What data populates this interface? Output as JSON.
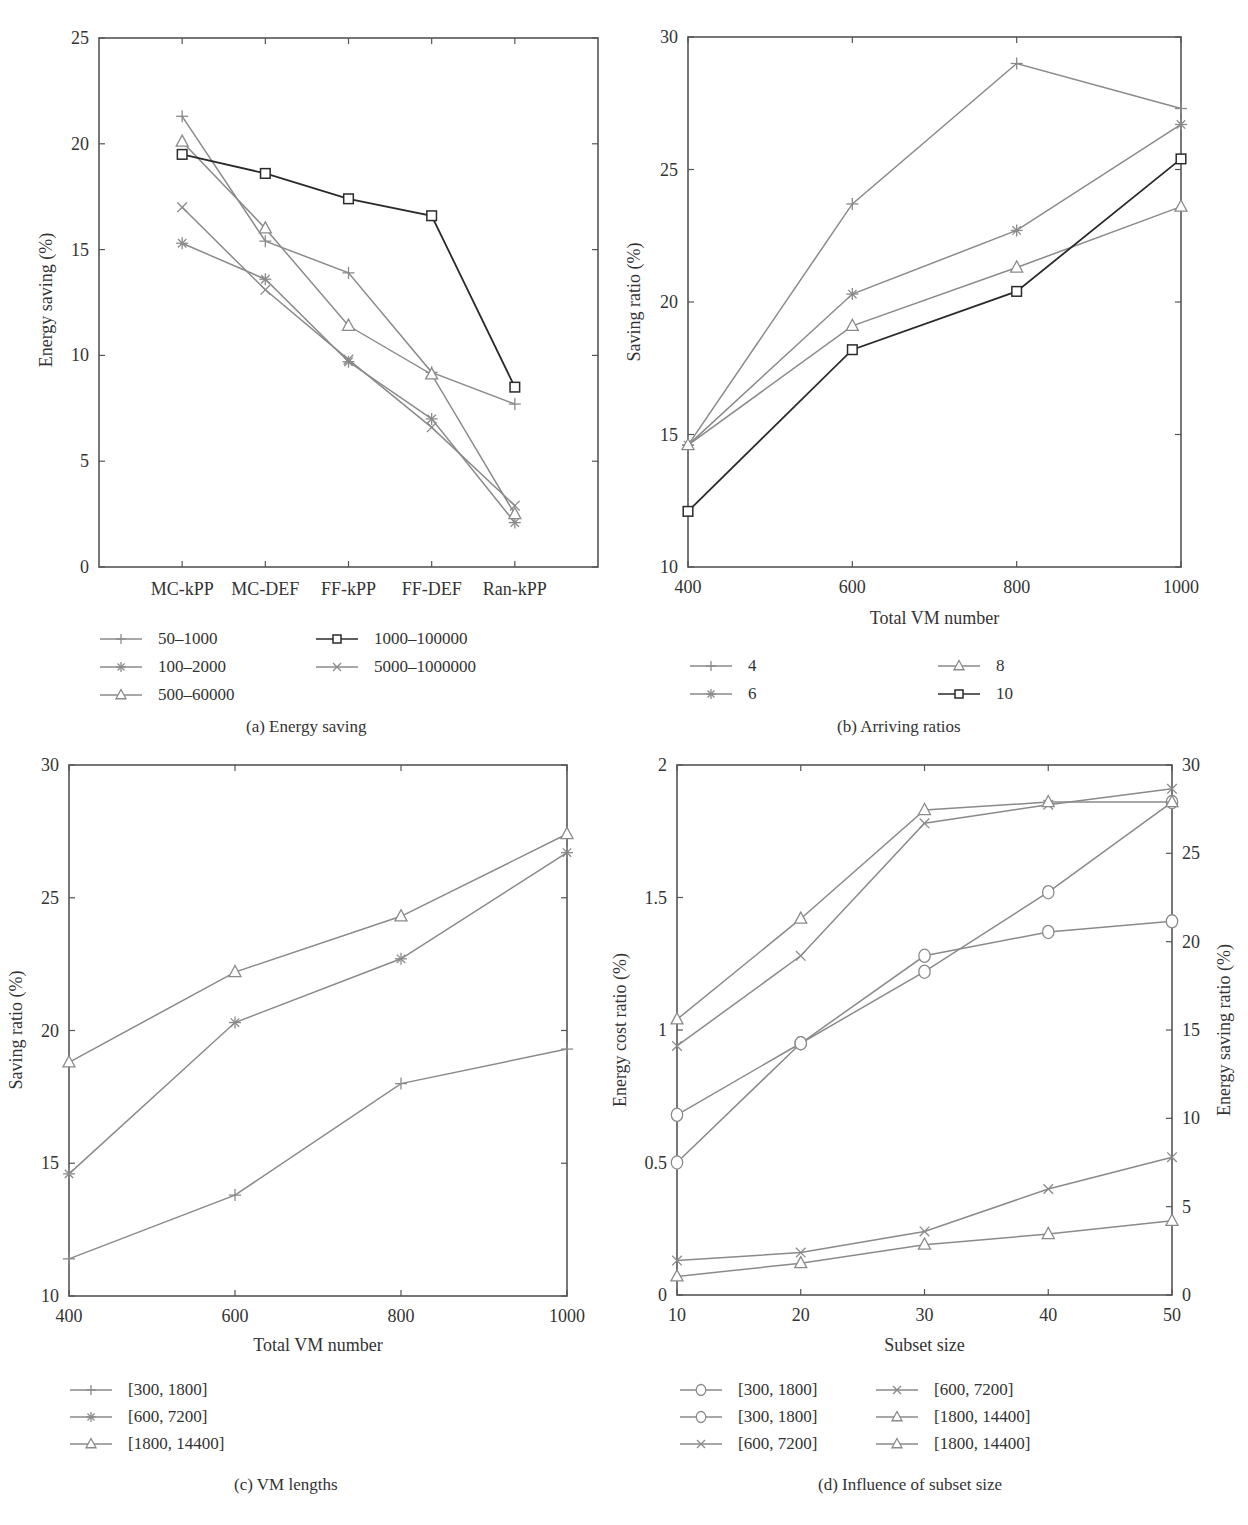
{
  "panels": {
    "a": {
      "caption": "(a)  Energy saving",
      "ylabel": "Energy saving (%)",
      "xlabel": "",
      "legend": [
        "50–1000",
        "100–2000",
        "500–60000",
        "1000–100000",
        "5000–1000000"
      ]
    },
    "b": {
      "caption": "(b)  Arriving ratios",
      "ylabel": "Saving ratio (%)",
      "xlabel": "Total VM number",
      "legend": [
        "4",
        "6",
        "8",
        "10"
      ]
    },
    "c": {
      "caption": "(c)  VM lengths",
      "ylabel": "Saving ratio (%)",
      "xlabel": "Total VM number",
      "legend": [
        "[300, 1800]",
        "[600, 7200]",
        "[1800, 14400]"
      ]
    },
    "d": {
      "caption": "(d)  Influence of subset size",
      "ylabel": "Energy cost ratio (%)",
      "ylabel_right": "Energy saving ratio (%)",
      "xlabel": "Subset size",
      "legend": [
        "[300, 1800]",
        "[300, 1800]",
        "[600, 7200]",
        "[600, 7200]",
        "[1800, 14400]",
        "[1800, 14400]"
      ]
    }
  },
  "chart_data": [
    {
      "id": "a",
      "type": "line",
      "title": "(a) Energy saving",
      "xlabel": "",
      "ylabel": "Energy saving (%)",
      "categories": [
        "MC-kPP",
        "MC-DEF",
        "FF-kPP",
        "FF-DEF",
        "Ran-kPP"
      ],
      "ylim": [
        0,
        25
      ],
      "yticks": [
        0,
        5,
        10,
        15,
        20,
        25
      ],
      "grid": false,
      "legend_position": "below",
      "series": [
        {
          "name": "50–1000",
          "marker": "plus",
          "color": "#8a8a8a",
          "values": [
            21.3,
            15.4,
            13.9,
            9.2,
            7.7
          ]
        },
        {
          "name": "100–2000",
          "marker": "asterisk",
          "color": "#8a8a8a",
          "values": [
            15.3,
            13.6,
            9.7,
            7.0,
            2.1
          ]
        },
        {
          "name": "500–60000",
          "marker": "triangle",
          "color": "#8a8a8a",
          "values": [
            20.1,
            16.0,
            11.4,
            9.1,
            2.5
          ]
        },
        {
          "name": "1000–100000",
          "marker": "square",
          "color": "#2a2a2a",
          "values": [
            19.5,
            18.6,
            17.4,
            16.6,
            8.5
          ]
        },
        {
          "name": "5000–1000000",
          "marker": "x",
          "color": "#8a8a8a",
          "values": [
            17.0,
            13.1,
            9.8,
            6.6,
            2.9
          ]
        }
      ]
    },
    {
      "id": "b",
      "type": "line",
      "title": "(b) Arriving ratios",
      "xlabel": "Total VM number",
      "ylabel": "Saving ratio (%)",
      "x": [
        400,
        600,
        800,
        1000
      ],
      "xlim": [
        400,
        1000
      ],
      "xticks": [
        400,
        600,
        800,
        1000
      ],
      "ylim": [
        10,
        30
      ],
      "yticks": [
        10,
        15,
        20,
        25,
        30
      ],
      "grid": false,
      "legend_position": "below",
      "series": [
        {
          "name": "4",
          "marker": "plus",
          "color": "#8a8a8a",
          "values": [
            14.6,
            23.7,
            29.0,
            27.3
          ]
        },
        {
          "name": "6",
          "marker": "asterisk",
          "color": "#8a8a8a",
          "values": [
            14.6,
            20.3,
            22.7,
            26.7
          ]
        },
        {
          "name": "8",
          "marker": "triangle",
          "color": "#8a8a8a",
          "values": [
            14.6,
            19.1,
            21.3,
            23.6
          ]
        },
        {
          "name": "10",
          "marker": "square",
          "color": "#2a2a2a",
          "values": [
            12.1,
            18.2,
            20.4,
            25.4
          ]
        }
      ]
    },
    {
      "id": "c",
      "type": "line",
      "title": "(c) VM lengths",
      "xlabel": "Total VM number",
      "ylabel": "Saving ratio (%)",
      "x": [
        400,
        600,
        800,
        1000
      ],
      "xlim": [
        400,
        1000
      ],
      "xticks": [
        400,
        600,
        800,
        1000
      ],
      "ylim": [
        10,
        30
      ],
      "yticks": [
        10,
        15,
        20,
        25,
        30
      ],
      "grid": false,
      "legend_position": "below",
      "series": [
        {
          "name": "[300, 1800]",
          "marker": "plus",
          "color": "#8a8a8a",
          "values": [
            11.4,
            13.8,
            18.0,
            19.3
          ]
        },
        {
          "name": "[600, 7200]",
          "marker": "asterisk",
          "color": "#8a8a8a",
          "values": [
            14.6,
            20.3,
            22.7,
            26.7
          ]
        },
        {
          "name": "[1800, 14400]",
          "marker": "triangle",
          "color": "#8a8a8a",
          "values": [
            18.8,
            22.2,
            24.3,
            27.4
          ]
        }
      ]
    },
    {
      "id": "d",
      "type": "line",
      "title": "(d) Influence of subset size",
      "xlabel": "Subset size",
      "ylabel": "Energy cost ratio (%)",
      "ylabel_right": "Energy saving ratio (%)",
      "x": [
        10,
        20,
        30,
        40,
        50
      ],
      "xlim": [
        10,
        50
      ],
      "xticks": [
        10,
        20,
        30,
        40,
        50
      ],
      "ylim": [
        0,
        2
      ],
      "yticks": [
        0,
        0.5,
        1,
        1.5,
        2
      ],
      "ylim_right": [
        0,
        30
      ],
      "yticks_right": [
        0,
        5,
        10,
        15,
        20,
        25,
        30
      ],
      "grid": false,
      "legend_position": "below",
      "note": "values expressed in left-axis units",
      "series": [
        {
          "name": "[300, 1800]",
          "marker": "circle",
          "color": "#8a8a8a",
          "values": [
            0.68,
            0.95,
            1.28,
            1.37,
            1.41
          ]
        },
        {
          "name": "[300, 1800]",
          "marker": "circle",
          "color": "#8a8a8a",
          "values": [
            0.5,
            0.95,
            1.22,
            1.52,
            1.86
          ]
        },
        {
          "name": "[600, 7200]",
          "marker": "x",
          "color": "#8a8a8a",
          "values": [
            0.13,
            0.16,
            0.24,
            0.4,
            0.52
          ]
        },
        {
          "name": "[600, 7200]",
          "marker": "x",
          "color": "#8a8a8a",
          "values": [
            0.94,
            1.28,
            1.78,
            1.85,
            1.91
          ]
        },
        {
          "name": "[1800, 14400]",
          "marker": "triangle",
          "color": "#8a8a8a",
          "values": [
            1.04,
            1.42,
            1.83,
            1.86,
            1.86
          ]
        },
        {
          "name": "[1800, 14400]",
          "marker": "triangle",
          "color": "#8a8a8a",
          "values": [
            0.07,
            0.12,
            0.19,
            0.23,
            0.28
          ]
        }
      ]
    }
  ]
}
